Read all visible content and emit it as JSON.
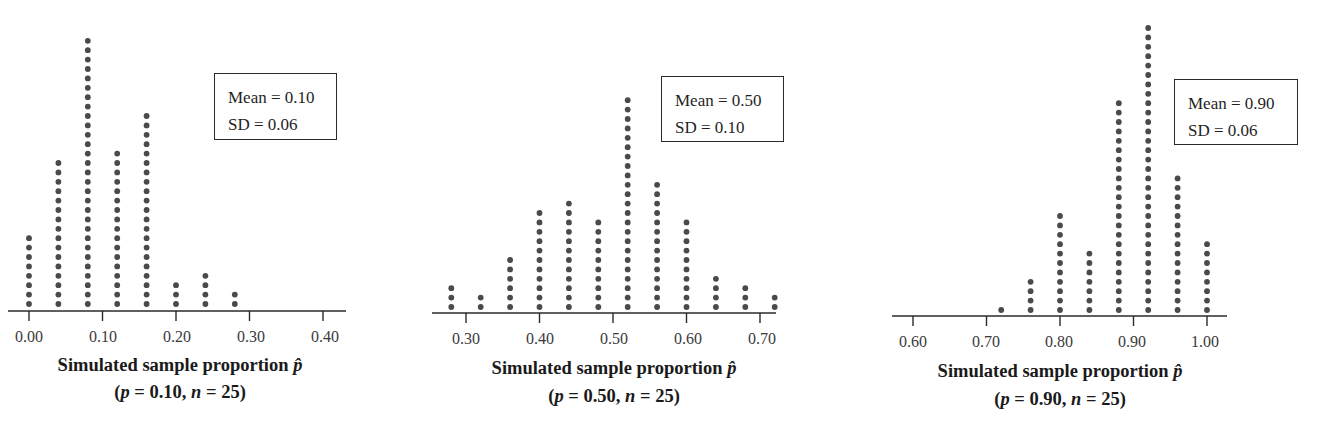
{
  "chart_data": [
    {
      "type": "dotplot",
      "title": "Simulated sample proportion p̂",
      "subtitle": "(p = 0.10, n = 25)",
      "xlabel": "Simulated sample proportion p̂",
      "ylabel": "",
      "xlim": [
        0.0,
        0.4
      ],
      "x_ticks": [
        "0.00",
        "0.10",
        "0.20",
        "0.30",
        "0.40"
      ],
      "x": [
        0.0,
        0.04,
        0.08,
        0.12,
        0.16,
        0.2,
        0.24,
        0.28
      ],
      "counts": [
        8,
        16,
        29,
        17,
        21,
        3,
        4,
        2
      ],
      "total": 100,
      "grid": false,
      "annotation": {
        "mean": "Mean = 0.10",
        "sd": "SD = 0.06"
      },
      "parameters": {
        "p": "0.10",
        "n": "25"
      }
    },
    {
      "type": "dotplot",
      "title": "Simulated sample proportion p̂",
      "subtitle": "(p = 0.50, n = 25)",
      "xlabel": "Simulated sample proportion p̂",
      "ylabel": "",
      "xlim": [
        0.28,
        0.72
      ],
      "x_ticks": [
        "0.30",
        "0.40",
        "0.50",
        "0.60",
        "0.70"
      ],
      "x": [
        0.28,
        0.32,
        0.36,
        0.4,
        0.44,
        0.48,
        0.52,
        0.56,
        0.6,
        0.64,
        0.68,
        0.72
      ],
      "counts": [
        3,
        2,
        6,
        11,
        12,
        10,
        23,
        14,
        10,
        4,
        3,
        2
      ],
      "total": 100,
      "grid": false,
      "annotation": {
        "mean": "Mean = 0.50",
        "sd": "SD = 0.10"
      },
      "parameters": {
        "p": "0.50",
        "n": "25"
      }
    },
    {
      "type": "dotplot",
      "title": "Simulated sample proportion p̂",
      "subtitle": "(p = 0.90, n = 25)",
      "xlabel": "Simulated sample proportion p̂",
      "ylabel": "",
      "xlim": [
        0.6,
        1.0
      ],
      "x_ticks": [
        "0.60",
        "0.70",
        "0.80",
        "0.90",
        "1.00"
      ],
      "x": [
        0.72,
        0.76,
        0.8,
        0.84,
        0.88,
        0.92,
        0.96,
        1.0
      ],
      "counts": [
        1,
        4,
        11,
        7,
        23,
        31,
        15,
        8
      ],
      "total": 100,
      "grid": false,
      "annotation": {
        "mean": "Mean = 0.90",
        "sd": "SD = 0.06"
      },
      "parameters": {
        "p": "0.90",
        "n": "25"
      }
    }
  ],
  "panels": [
    {
      "stats": {
        "mean": "Mean = 0.10",
        "sd": "SD = 0.06"
      },
      "ticks": [
        "0.00",
        "0.10",
        "0.20",
        "0.30",
        "0.40"
      ],
      "xlabel": "Simulated sample proportion",
      "sub": {
        "open": "(",
        "p_sym": "p",
        "p_val": " = 0.10, ",
        "n_sym": "n",
        "n_val": " = 25)"
      }
    },
    {
      "stats": {
        "mean": "Mean = 0.50",
        "sd": "SD = 0.10"
      },
      "ticks": [
        "0.30",
        "0.40",
        "0.50",
        "0.60",
        "0.70"
      ],
      "xlabel": "Simulated sample proportion",
      "sub": {
        "open": "(",
        "p_sym": "p",
        "p_val": " = 0.50, ",
        "n_sym": "n",
        "n_val": " = 25)"
      }
    },
    {
      "stats": {
        "mean": "Mean = 0.90",
        "sd": "SD = 0.06"
      },
      "ticks": [
        "0.60",
        "0.70",
        "0.80",
        "0.90",
        "1.00"
      ],
      "xlabel": "Simulated sample proportion",
      "sub": {
        "open": "(",
        "p_sym": "p",
        "p_val": " = 0.90, ",
        "n_sym": "n",
        "n_val": " = 25)"
      }
    }
  ],
  "phat_symbol": "p̂",
  "colors": {
    "dot": "#4a4a4a",
    "axis": "#2a2a2a",
    "text": "#1a1a1a"
  }
}
